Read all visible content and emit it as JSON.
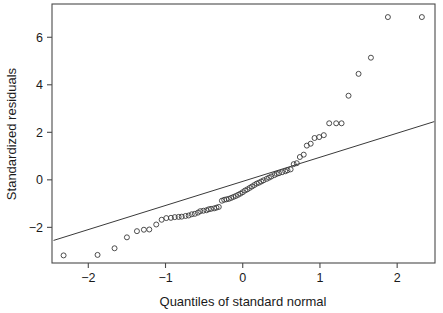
{
  "chart_data": {
    "type": "scatter",
    "title": "",
    "xlabel": "Quantiles of standard normal",
    "ylabel": "Standardized residuals",
    "xlim": [
      -2.47,
      2.49
    ],
    "ylim": [
      -3.5,
      7.4
    ],
    "xticks": [
      -2,
      -1,
      0,
      1,
      2
    ],
    "xtick_labels": [
      "-2",
      "-1",
      "0",
      "1",
      "2"
    ],
    "yticks": [
      -2,
      0,
      2,
      4,
      6
    ],
    "ytick_labels": [
      "-2",
      "0",
      "2",
      "4",
      "6"
    ],
    "grid": false,
    "legend": "none",
    "marker": "open-circle",
    "marker_color": "#3a3a3a",
    "line_color": "#3a3a3a",
    "frame_color": "#4a4a4a",
    "background": "#ffffff",
    "reference_line": {
      "label": "qq-reference-line",
      "x": [
        -2.45,
        2.48
      ],
      "y": [
        -2.55,
        2.45
      ]
    },
    "series": [
      {
        "name": "Standardized residuals",
        "x": [
          -2.32,
          -1.88,
          -1.66,
          -1.5,
          -1.37,
          -1.28,
          -1.21,
          -1.12,
          -1.05,
          -0.99,
          -0.93,
          -0.88,
          -0.83,
          -0.79,
          -0.74,
          -0.7,
          -0.66,
          -0.62,
          -0.58,
          -0.55,
          -0.51,
          -0.47,
          -0.44,
          -0.41,
          -0.37,
          -0.34,
          -0.31,
          -0.27,
          -0.24,
          -0.21,
          -0.18,
          -0.15,
          -0.12,
          -0.09,
          -0.06,
          -0.03,
          0.0,
          0.03,
          0.06,
          0.09,
          0.12,
          0.15,
          0.18,
          0.21,
          0.24,
          0.27,
          0.31,
          0.34,
          0.37,
          0.41,
          0.44,
          0.47,
          0.51,
          0.55,
          0.58,
          0.62,
          0.66,
          0.7,
          0.74,
          0.79,
          0.83,
          0.88,
          0.93,
          0.99,
          1.05,
          1.12,
          1.21,
          1.28,
          1.37,
          1.5,
          1.66,
          1.88,
          2.32
        ],
        "y": [
          -3.18,
          -3.16,
          -2.88,
          -2.42,
          -2.16,
          -2.1,
          -2.09,
          -1.88,
          -1.68,
          -1.61,
          -1.6,
          -1.57,
          -1.56,
          -1.55,
          -1.52,
          -1.5,
          -1.45,
          -1.43,
          -1.38,
          -1.32,
          -1.3,
          -1.28,
          -1.24,
          -1.22,
          -1.2,
          -1.17,
          -1.14,
          -0.88,
          -0.84,
          -0.82,
          -0.8,
          -0.76,
          -0.72,
          -0.68,
          -0.63,
          -0.58,
          -0.52,
          -0.45,
          -0.4,
          -0.34,
          -0.28,
          -0.22,
          -0.16,
          -0.12,
          -0.07,
          -0.02,
          0.04,
          0.09,
          0.14,
          0.2,
          0.25,
          0.28,
          0.32,
          0.36,
          0.4,
          0.44,
          0.66,
          0.7,
          0.96,
          1.06,
          1.44,
          1.52,
          1.76,
          1.8,
          1.88,
          2.38,
          2.38,
          2.38,
          3.54,
          4.46,
          5.14,
          6.85,
          6.85
        ]
      }
    ]
  },
  "axis": {
    "x_title": "Quantiles of standard normal",
    "y_title": "Standardized residuals"
  }
}
